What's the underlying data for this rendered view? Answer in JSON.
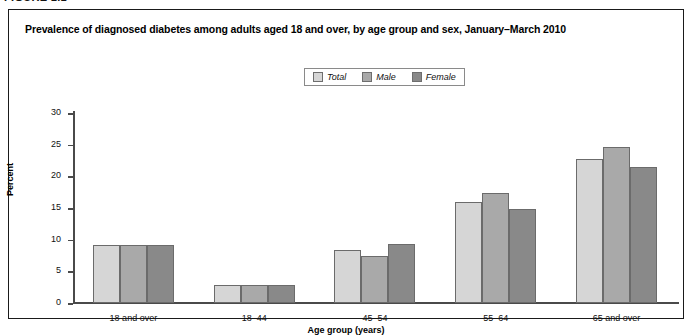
{
  "figure_label": "FIGURE 1.1",
  "chart_title": "Prevalence of diagnosed diabetes among adults aged 18 and over, by age group and sex, January–March 2010",
  "colors": {
    "total": "#d6d6d6",
    "male": "#a9a9a9",
    "female": "#898989",
    "bar_outline": "#6b6b6b",
    "axis": "#4a4a4a",
    "border": "#1a1a1a"
  },
  "chart_data": {
    "type": "bar",
    "title": "Prevalence of diagnosed diabetes among adults aged 18 and over, by age group and sex, January–March 2010",
    "xlabel": "Age group (years)",
    "ylabel": "Percent",
    "ylim": [
      0,
      30
    ],
    "yticks": [
      "0",
      "5",
      "10",
      "15",
      "20",
      "25",
      "30"
    ],
    "ytick_values": [
      0,
      5,
      10,
      15,
      20,
      25,
      30
    ],
    "grid": false,
    "legend_position": "top-center",
    "categories": [
      "18 and over",
      "18–44",
      "45–54",
      "55–64",
      "65 and over"
    ],
    "series": [
      {
        "name": "Total",
        "values": [
          9.2,
          2.9,
          8.3,
          16.0,
          22.8
        ]
      },
      {
        "name": "Male",
        "values": [
          9.2,
          2.9,
          7.4,
          17.3,
          24.7
        ]
      },
      {
        "name": "Female",
        "values": [
          9.2,
          2.9,
          9.3,
          14.8,
          21.4
        ]
      }
    ]
  }
}
